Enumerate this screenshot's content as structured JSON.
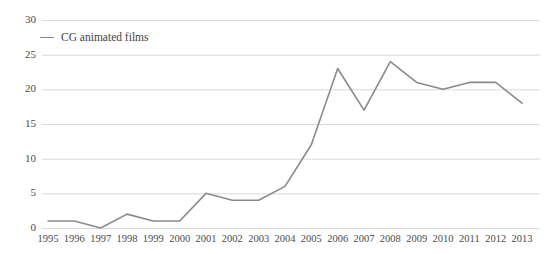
{
  "chart_data": {
    "type": "line",
    "title": "",
    "xlabel": "",
    "ylabel": "",
    "x": [
      1995,
      1996,
      1997,
      1998,
      1999,
      2000,
      2001,
      2002,
      2003,
      2004,
      2005,
      2006,
      2007,
      2008,
      2009,
      2010,
      2011,
      2012,
      2013
    ],
    "xtick_labels": [
      "1995",
      "1996",
      "1997",
      "1998",
      "1999",
      "2000",
      "2001",
      "2002",
      "2003",
      "2004",
      "2005",
      "2006",
      "2007",
      "2008",
      "2009",
      "2010",
      "2011",
      "2012",
      "2013"
    ],
    "series": [
      {
        "name": "CG animated films",
        "values": [
          1,
          1,
          0,
          2,
          1,
          1,
          5,
          4,
          4,
          6,
          12,
          23,
          17,
          24,
          21,
          20,
          21,
          21,
          18
        ],
        "color": "#8a8a8a"
      }
    ],
    "ylim": [
      0,
      30
    ],
    "ytick_labels": [
      "0",
      "5",
      "10",
      "15",
      "20",
      "25",
      "30"
    ],
    "ytick_values": [
      0,
      5,
      10,
      15,
      20,
      25,
      30
    ],
    "grid": "horizontal",
    "legend_position": "top-left",
    "legend_entries": [
      "CG animated films"
    ],
    "gridline_color": "#d9d9d9",
    "tick_label_color": "#4a4a4a",
    "background_color": "#ffffff"
  }
}
